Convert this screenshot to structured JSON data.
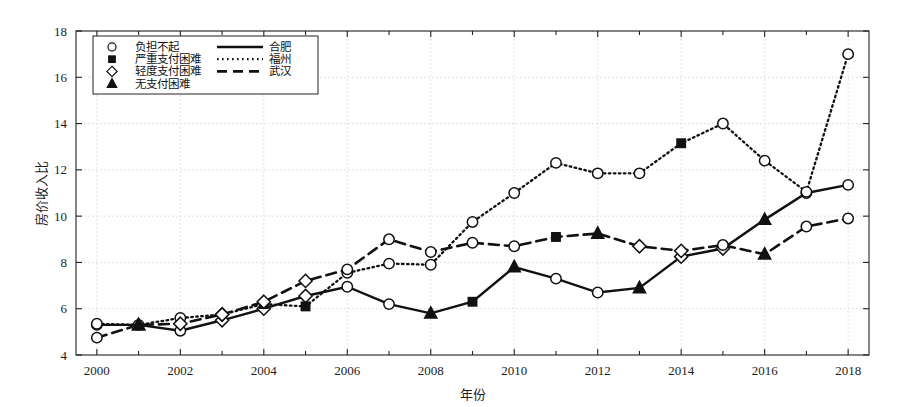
{
  "chart_data": {
    "type": "line",
    "title": "",
    "xlabel": "年份",
    "ylabel": "房价收入比",
    "xlim": [
      1999.5,
      2018.5
    ],
    "ylim": [
      4,
      18
    ],
    "yticks": [
      4,
      6,
      8,
      10,
      12,
      14,
      16,
      18
    ],
    "xticks": [
      2000,
      2002,
      2004,
      2006,
      2008,
      2010,
      2012,
      2014,
      2016,
      2018
    ],
    "xtick_labels": [
      "2000",
      "2002",
      "2004",
      "2006",
      "2008",
      "2010",
      "2012",
      "2014",
      "2016",
      "2018"
    ],
    "ytick_labels": [
      "4",
      "6",
      "8",
      "10",
      "12",
      "14",
      "16",
      "18"
    ],
    "x": [
      2000,
      2001,
      2002,
      2003,
      2004,
      2005,
      2006,
      2007,
      2008,
      2009,
      2010,
      2011,
      2012,
      2013,
      2014,
      2015,
      2016,
      2017,
      2018
    ],
    "grid": true,
    "legend_position": "upper-left",
    "series": [
      {
        "name": "合肥",
        "line_style": "solid",
        "values": [
          5.3,
          5.3,
          5.05,
          5.5,
          6.0,
          6.55,
          6.95,
          6.2,
          5.8,
          6.3,
          7.8,
          7.3,
          6.7,
          6.9,
          8.25,
          8.6,
          9.85,
          11.0,
          11.35
        ]
      },
      {
        "name": "福州",
        "line_style": "dotted",
        "values": [
          5.35,
          5.3,
          5.6,
          5.75,
          6.2,
          6.1,
          7.55,
          7.95,
          7.9,
          9.75,
          11.0,
          12.3,
          11.85,
          11.85,
          13.15,
          14.0,
          12.4,
          11.05,
          17.0
        ]
      },
      {
        "name": "武汉",
        "line_style": "dashed",
        "values": [
          4.75,
          5.3,
          5.35,
          5.75,
          6.3,
          7.2,
          7.7,
          9.0,
          8.45,
          8.85,
          8.7,
          9.1,
          9.25,
          8.7,
          8.5,
          8.75,
          8.35,
          9.55,
          9.9
        ]
      }
    ],
    "marker_legend": [
      {
        "symbol": "circle-open",
        "label": "负担不起"
      },
      {
        "symbol": "square-filled",
        "label": "严重支付困难"
      },
      {
        "symbol": "diamond-open",
        "label": "轻度支付困难"
      },
      {
        "symbol": "triangle-filled",
        "label": "无支付困难"
      }
    ],
    "marker_by_point": {
      "合肥": [
        "circle",
        "circle",
        "circle",
        "diamond",
        "diamond",
        "diamond",
        "circle",
        "circle",
        "triangle",
        "square",
        "triangle",
        "circle",
        "circle",
        "triangle",
        "diamond",
        "diamond",
        "triangle",
        "circle",
        "circle"
      ],
      "福州": [
        "circle",
        "triangle",
        "circle",
        "diamond",
        "square",
        "square",
        "circle",
        "circle",
        "circle",
        "circle",
        "circle",
        "circle",
        "circle",
        "circle",
        "square",
        "circle",
        "circle",
        "circle",
        "circle"
      ],
      "武汉": [
        "circle",
        "triangle",
        "diamond",
        "diamond",
        "diamond",
        "diamond",
        "circle",
        "circle",
        "circle",
        "circle",
        "circle",
        "square",
        "triangle",
        "diamond",
        "diamond",
        "circle",
        "triangle",
        "circle",
        "circle"
      ]
    },
    "colors": {
      "line": "#111111",
      "grid": "#d9d9d9",
      "axis": "#222222",
      "background": "#ffffff"
    }
  }
}
